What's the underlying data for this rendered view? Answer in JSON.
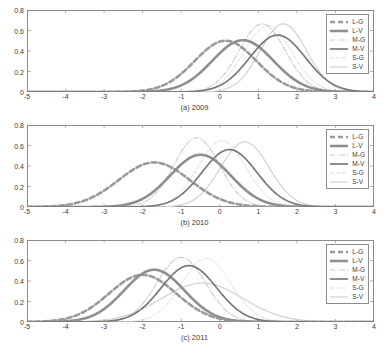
{
  "figure": {
    "panels": [
      {
        "id": "a",
        "caption": "(a) 2009"
      },
      {
        "id": "b",
        "caption": "(b) 2010"
      },
      {
        "id": "c",
        "caption": "(c) 2011"
      }
    ]
  },
  "axes": {
    "yticks": [
      "0.8",
      "0.6",
      "0.4",
      "0.2",
      "0"
    ],
    "ytick_values": [
      0.8,
      0.6,
      0.4,
      0.2,
      0
    ],
    "xticks": [
      "-5",
      "-4",
      "-3",
      "-2",
      "-1",
      "0",
      "1",
      "2",
      "3",
      "4"
    ],
    "xtick_values": [
      -5,
      -4,
      -3,
      -2,
      -1,
      0,
      1,
      2,
      3,
      4
    ],
    "xlim": [
      -5,
      4
    ],
    "ylim": [
      0,
      0.8
    ]
  },
  "legend": {
    "entries": [
      {
        "label": "L-G",
        "color": "#9a9a9a",
        "width": 2.6,
        "dash": "5,3"
      },
      {
        "label": "L-V",
        "color": "#8f8f8f",
        "width": 2.6,
        "dash": "none"
      },
      {
        "label": "M-G",
        "color": "#c9c9c9",
        "width": 1.1,
        "dash": "5,2,1,2"
      },
      {
        "label": "M-V",
        "color": "#7a7a7a",
        "width": 1.7,
        "dash": "none"
      },
      {
        "label": "S-G",
        "color": "#dcdcdc",
        "width": 1.0,
        "dash": "4,2"
      },
      {
        "label": "S-V",
        "color": "#d2d2d2",
        "width": 1.2,
        "dash": "none"
      }
    ]
  },
  "chart_data": {
    "type": "line",
    "title": "",
    "xlabel": "",
    "ylabel": "",
    "xlim": [
      -5,
      4
    ],
    "ylim": [
      0,
      0.8
    ],
    "grid": false,
    "legend_position": "top-right",
    "panels": [
      {
        "name": "(a) 2009",
        "series": [
          {
            "name": "L-G",
            "mean": 0.15,
            "sigma": 0.8,
            "peak": 0.5
          },
          {
            "name": "L-V",
            "mean": 0.6,
            "sigma": 0.79,
            "peak": 0.505
          },
          {
            "name": "M-G",
            "mean": 1.1,
            "sigma": 0.6,
            "peak": 0.665
          },
          {
            "name": "M-V",
            "mean": 1.5,
            "sigma": 0.72,
            "peak": 0.555
          },
          {
            "name": "S-G",
            "mean": 1.25,
            "sigma": 0.62,
            "peak": 0.645
          },
          {
            "name": "S-V",
            "mean": 1.65,
            "sigma": 0.6,
            "peak": 0.665
          }
        ]
      },
      {
        "name": "(b) 2010",
        "series": [
          {
            "name": "L-G",
            "mean": -1.7,
            "sigma": 0.92,
            "peak": 0.435
          },
          {
            "name": "L-V",
            "mean": -0.5,
            "sigma": 0.78,
            "peak": 0.51
          },
          {
            "name": "M-G",
            "mean": -0.6,
            "sigma": 0.59,
            "peak": 0.675
          },
          {
            "name": "M-V",
            "mean": 0.25,
            "sigma": 0.71,
            "peak": 0.56
          },
          {
            "name": "S-G",
            "mean": 0.05,
            "sigma": 0.62,
            "peak": 0.645
          },
          {
            "name": "S-V",
            "mean": 0.65,
            "sigma": 0.63,
            "peak": 0.635
          }
        ]
      },
      {
        "name": "(c) 2011",
        "series": [
          {
            "name": "L-G",
            "mean": -2.0,
            "sigma": 0.87,
            "peak": 0.46
          },
          {
            "name": "L-V",
            "mean": -1.7,
            "sigma": 0.78,
            "peak": 0.51
          },
          {
            "name": "M-G",
            "mean": -1.0,
            "sigma": 0.63,
            "peak": 0.63
          },
          {
            "name": "M-V",
            "mean": -0.8,
            "sigma": 0.72,
            "peak": 0.55
          },
          {
            "name": "S-G",
            "mean": -0.35,
            "sigma": 0.64,
            "peak": 0.62
          },
          {
            "name": "S-V",
            "mean": -0.45,
            "sigma": 1.05,
            "peak": 0.38
          }
        ]
      }
    ]
  }
}
